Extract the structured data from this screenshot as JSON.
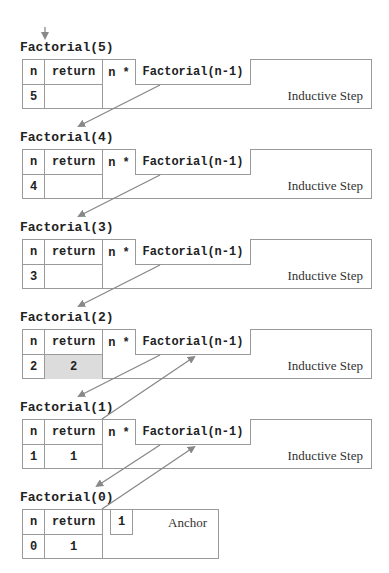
{
  "diagram": {
    "colors": {
      "border": "#9a9a9a",
      "arrow": "#888888",
      "highlight": "#dcdcdc",
      "text": "#222222"
    },
    "headers": {
      "n": "n",
      "return": "return",
      "n_star": "n *",
      "call": "Factorial(n-1)"
    },
    "frames": [
      {
        "title": "Factorial(5)",
        "n": "5",
        "return": "",
        "label": "Inductive Step",
        "highlighted": false
      },
      {
        "title": "Factorial(4)",
        "n": "4",
        "return": "",
        "label": "Inductive Step",
        "highlighted": false
      },
      {
        "title": "Factorial(3)",
        "n": "3",
        "return": "",
        "label": "Inductive Step",
        "highlighted": false
      },
      {
        "title": "Factorial(2)",
        "n": "2",
        "return": "2",
        "label": "Inductive Step",
        "highlighted": true
      },
      {
        "title": "Factorial(1)",
        "n": "1",
        "return": "1",
        "label": "Inductive Step",
        "highlighted": false
      }
    ],
    "anchor_frame": {
      "title": "Factorial(0)",
      "n": "0",
      "return": "1",
      "value": "1",
      "label": "Anchor"
    },
    "arrows": {
      "entry": {
        "from": [
          45,
          27
        ],
        "to": [
          45,
          39
        ]
      },
      "calls": [
        {
          "from": [
            160,
            85
          ],
          "to": [
            77,
            127
          ]
        },
        {
          "from": [
            160,
            175
          ],
          "to": [
            77,
            217
          ]
        },
        {
          "from": [
            160,
            265
          ],
          "to": [
            77,
            307
          ]
        },
        {
          "from": [
            160,
            355
          ],
          "to": [
            77,
            397
          ]
        },
        {
          "from": [
            160,
            445
          ],
          "to": [
            96,
            487
          ]
        }
      ],
      "returns": [
        {
          "from": [
            102,
            419
          ],
          "to": [
            195,
            356
          ]
        },
        {
          "from": [
            102,
            509
          ],
          "to": [
            195,
            446
          ]
        }
      ]
    }
  }
}
